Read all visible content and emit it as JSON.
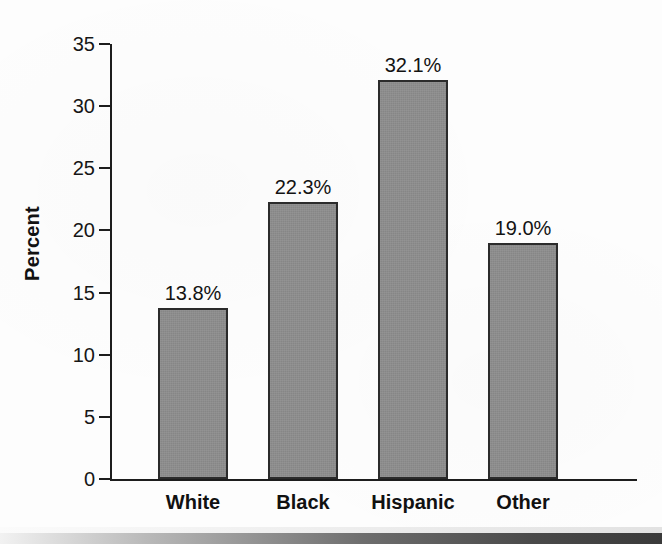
{
  "chart_data": {
    "type": "bar",
    "title": "",
    "xlabel": "",
    "ylabel": "Percent",
    "categories": [
      "White",
      "Black",
      "Hispanic",
      "Other"
    ],
    "values": [
      13.8,
      22.3,
      32.1,
      19.0
    ],
    "data_labels": [
      "13.8%",
      "22.3%",
      "32.1%",
      "19.0%"
    ],
    "ylim": [
      0,
      35
    ],
    "yticks": [
      0,
      5,
      10,
      15,
      20,
      25,
      30,
      35
    ],
    "ytick_labels": [
      "0",
      "5",
      "10",
      "15",
      "20",
      "25",
      "30",
      "35"
    ],
    "grid": false,
    "legend": null,
    "bar_color": "#8c8c8c",
    "bar_edge_color": "#2b2b2b",
    "axis_color": "#1d1d1d",
    "background_color": "#fdfdfd"
  }
}
